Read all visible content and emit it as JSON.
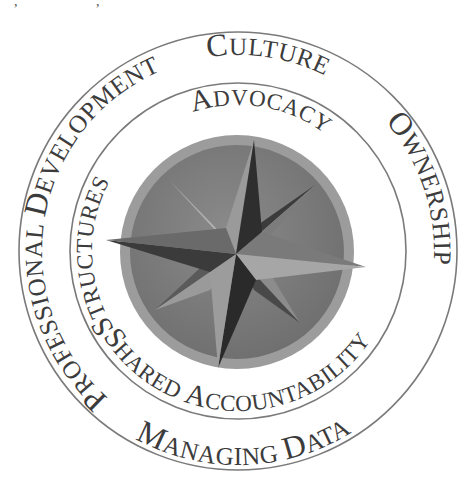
{
  "figure": {
    "type": "concentric-ring-diagram",
    "center_emblem": "eight-pointed-compass-star",
    "colors": {
      "text": "#3c3c3c",
      "ring_stroke": "#7a7a7a",
      "medallion_rim": "#9c9c9c",
      "medallion_disc": "#7d7d7d",
      "star_light": "#a8a8a8",
      "star_mid": "#6f6f6f",
      "star_dark": "#2e2e2e"
    },
    "outer_ring": {
      "labels": [
        {
          "first": "C",
          "rest": "ULTURE",
          "text": "Culture"
        },
        {
          "first": "O",
          "rest": "WNERSHIP",
          "text": "Ownership"
        },
        {
          "first": "M",
          "rest": "ANAGING ",
          "first2": "D",
          "rest2": "ATA",
          "text": "Managing Data"
        },
        {
          "first": "P",
          "rest": "ROFESSIONAL ",
          "first2": "D",
          "rest2": "EVELOPMENT",
          "text": "Professional Development"
        }
      ]
    },
    "inner_ring": {
      "labels": [
        {
          "first": "A",
          "rest": "DVOCACY",
          "text": "Advocacy"
        },
        {
          "first": "S",
          "rest": "HARED ",
          "first2": "A",
          "rest2": "CCOUNTABILITY",
          "text": "Shared Accountability"
        },
        {
          "first": "S",
          "rest": "TRUCTURES",
          "text": "Structures"
        }
      ]
    }
  }
}
